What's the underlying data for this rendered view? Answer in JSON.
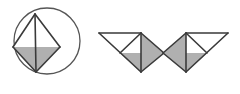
{
  "document": {
    "title": "Geometric figure series",
    "background_color": "#ffffff",
    "width": 240,
    "height": 94
  },
  "style": {
    "stroke_color": "#3a3a3a",
    "stroke_color_light": "#555555",
    "fill_gray": "#b0b0b0",
    "fill_white": "#ffffff",
    "stroke_width": 1.6,
    "circle_stroke_width": 1.3
  },
  "figures": [
    {
      "id": "figure-1",
      "label": "circled arrowhead",
      "circle": {
        "cx": 47,
        "cy": 41,
        "r": 33
      },
      "shapes": [
        {
          "name": "white-upper-triangle",
          "fill": "#ffffff",
          "points": "35,14 13,47 35,47"
        },
        {
          "name": "white-right-triangle",
          "fill": "#ffffff",
          "points": "35,14 60,47 35,47"
        },
        {
          "name": "gray-left-lower-triangle",
          "fill": "#b0b0b0",
          "points": "13,47 35,47 36,72"
        },
        {
          "name": "gray-right-lower-triangle",
          "fill": "#b0b0b0",
          "points": "35,47 60,47 36,72"
        }
      ],
      "lines": [
        {
          "name": "left-upper-edge",
          "x1": 35,
          "y1": 14,
          "x2": 13,
          "y2": 47
        },
        {
          "name": "right-upper-edge",
          "x1": 35,
          "y1": 14,
          "x2": 60,
          "y2": 47
        },
        {
          "name": "left-lower-edge",
          "x1": 13,
          "y1": 47,
          "x2": 36,
          "y2": 72
        },
        {
          "name": "right-lower-edge",
          "x1": 60,
          "y1": 47,
          "x2": 36,
          "y2": 72
        },
        {
          "name": "vertical-axis",
          "x1": 35,
          "y1": 14,
          "x2": 36,
          "y2": 72
        }
      ]
    },
    {
      "id": "figure-2",
      "label": "right-facing arrowhead",
      "shapes": [
        {
          "name": "white-top-triangle",
          "fill": "#ffffff",
          "points": "99,33 141,33 120,53"
        },
        {
          "name": "white-inner-right-triangle",
          "fill": "#ffffff",
          "points": "141,33 120,53 141,53"
        },
        {
          "name": "gray-left-lower-triangle",
          "fill": "#b0b0b0",
          "points": "99,33 120,53 141,72"
        },
        {
          "name": "gray-right-lower-triangle",
          "fill": "#b0b0b0",
          "points": "141,33 164,53 141,72"
        },
        {
          "name": "gray-center-lower-triangle",
          "fill": "#b0b0b0",
          "points": "120,53 141,53 141,72"
        }
      ],
      "lines": [
        {
          "name": "top-edge",
          "x1": 99,
          "y1": 33,
          "x2": 141,
          "y2": 33
        },
        {
          "name": "diagonal-down-right",
          "x1": 99,
          "y1": 33,
          "x2": 141,
          "y2": 72
        },
        {
          "name": "inner-diagonal",
          "x1": 141,
          "y1": 33,
          "x2": 120,
          "y2": 53
        },
        {
          "name": "right-upper-edge",
          "x1": 141,
          "y1": 33,
          "x2": 164,
          "y2": 53
        },
        {
          "name": "right-lower-edge",
          "x1": 164,
          "y1": 53,
          "x2": 141,
          "y2": 72
        },
        {
          "name": "vertical-axis",
          "x1": 141,
          "y1": 33,
          "x2": 141,
          "y2": 72
        }
      ]
    },
    {
      "id": "figure-3",
      "label": "left-facing arrowhead",
      "shapes": [
        {
          "name": "white-top-triangle",
          "fill": "#ffffff",
          "points": "228,33 186,33 207,53"
        },
        {
          "name": "white-inner-left-triangle",
          "fill": "#ffffff",
          "points": "186,33 207,53 186,53"
        },
        {
          "name": "gray-right-lower-triangle",
          "fill": "#b0b0b0",
          "points": "228,33 207,53 186,72"
        },
        {
          "name": "gray-left-lower-triangle",
          "fill": "#b0b0b0",
          "points": "186,33 163,53 186,72"
        },
        {
          "name": "gray-center-lower-triangle",
          "fill": "#b0b0b0",
          "points": "207,53 186,53 186,72"
        }
      ],
      "lines": [
        {
          "name": "top-edge",
          "x1": 228,
          "y1": 33,
          "x2": 186,
          "y2": 33
        },
        {
          "name": "diagonal-down-left",
          "x1": 228,
          "y1": 33,
          "x2": 186,
          "y2": 72
        },
        {
          "name": "inner-diagonal",
          "x1": 186,
          "y1": 33,
          "x2": 207,
          "y2": 53
        },
        {
          "name": "left-upper-edge",
          "x1": 186,
          "y1": 33,
          "x2": 163,
          "y2": 53
        },
        {
          "name": "left-lower-edge",
          "x1": 163,
          "y1": 53,
          "x2": 186,
          "y2": 72
        },
        {
          "name": "vertical-axis",
          "x1": 186,
          "y1": 33,
          "x2": 186,
          "y2": 72
        }
      ]
    }
  ]
}
